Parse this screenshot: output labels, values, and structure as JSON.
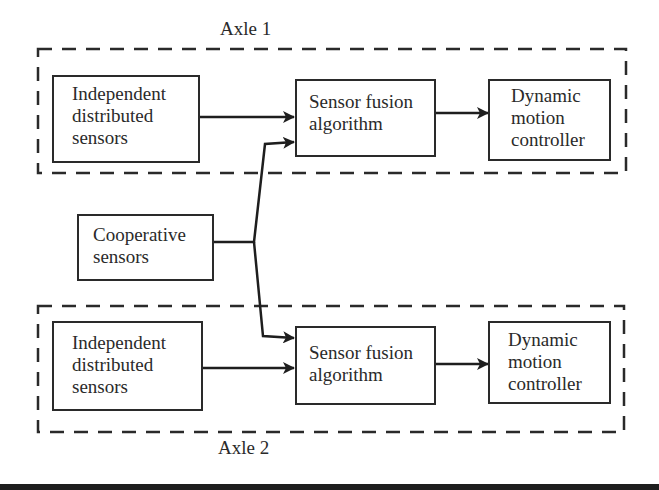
{
  "groups": [
    {
      "label": "Axle 1"
    },
    {
      "label": "Axle 2"
    }
  ],
  "nodes": {
    "ids1": {
      "lines": [
        "Independent",
        "distributed",
        "sensors"
      ]
    },
    "sfa1": {
      "lines": [
        "Sensor fusion",
        "algorithm"
      ]
    },
    "dmc1": {
      "lines": [
        "Dynamic",
        "motion",
        "controller"
      ]
    },
    "coop": {
      "lines": [
        "Cooperative",
        "sensors"
      ]
    },
    "ids2": {
      "lines": [
        "Independent",
        "distributed",
        "sensors"
      ]
    },
    "sfa2": {
      "lines": [
        "Sensor fusion",
        "algorithm"
      ]
    },
    "dmc2": {
      "lines": [
        "Dynamic",
        "motion",
        "controller"
      ]
    }
  },
  "edges": [
    {
      "from": "Independent distributed sensors (Axle 1)",
      "to": "Sensor fusion algorithm (Axle 1)"
    },
    {
      "from": "Cooperative sensors",
      "to": "Sensor fusion algorithm (Axle 1)"
    },
    {
      "from": "Sensor fusion algorithm (Axle 1)",
      "to": "Dynamic motion controller (Axle 1)"
    },
    {
      "from": "Independent distributed sensors (Axle 2)",
      "to": "Sensor fusion algorithm (Axle 2)"
    },
    {
      "from": "Cooperative sensors",
      "to": "Sensor fusion algorithm (Axle 2)"
    },
    {
      "from": "Sensor fusion algorithm (Axle 2)",
      "to": "Dynamic motion controller (Axle 2)"
    }
  ]
}
